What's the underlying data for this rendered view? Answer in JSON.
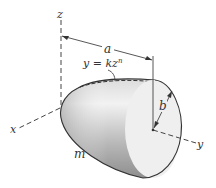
{
  "figure": {
    "labels": {
      "z_axis": "z",
      "x_axis": "x",
      "y_axis": "y",
      "length": "a",
      "radius": "b",
      "mass": "m",
      "curve_eq_lhs": "y = kz",
      "curve_eq_exp": "n"
    },
    "colors": {
      "line": "#333333",
      "body_dark": "#8a8a8a",
      "body_light": "#e6e6e6",
      "face": "#efefef"
    }
  }
}
